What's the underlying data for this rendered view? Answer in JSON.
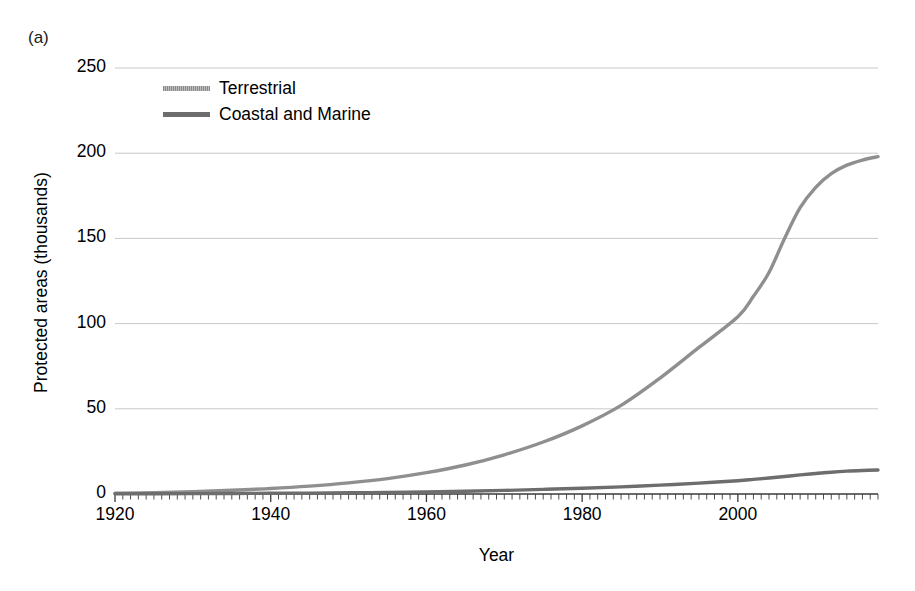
{
  "panel": {
    "label": "(a)"
  },
  "axes": {
    "ylabel": "Protected areas (thousands)",
    "xlabel": "Year",
    "yticks": [
      "0",
      "50",
      "100",
      "150",
      "200",
      "250"
    ],
    "xticks": [
      "1920",
      "1940",
      "1960",
      "1980",
      "2000"
    ]
  },
  "legend": {
    "items": [
      {
        "label": "Terrestrial",
        "color": "#9a9a9a"
      },
      {
        "label": "Coastal and Marine",
        "color": "#6d6d6d"
      }
    ]
  },
  "colors": {
    "terrestrial": "#8f8f8f",
    "coastal": "#6d6d6d",
    "gridline": "#c9c9c9",
    "axis": "#3a3a3a",
    "text": "#000000",
    "background": "#ffffff"
  },
  "chart_data": {
    "type": "line",
    "title": "",
    "subtitle": "",
    "xlabel": "Year",
    "ylabel": "Protected areas (thousands)",
    "xlim": [
      1920,
      2018
    ],
    "ylim": [
      0,
      250
    ],
    "grid": true,
    "legend_position": "top-left",
    "x_major_ticks": [
      1920,
      1940,
      1960,
      1980,
      2000
    ],
    "x_minor_tick_interval": 1,
    "y_ticks": [
      0,
      50,
      100,
      150,
      200,
      250
    ],
    "x": [
      1920,
      1925,
      1930,
      1935,
      1940,
      1945,
      1950,
      1955,
      1960,
      1965,
      1970,
      1975,
      1980,
      1985,
      1990,
      1995,
      2000,
      2002,
      2004,
      2006,
      2008,
      2010,
      2012,
      2014,
      2016,
      2018
    ],
    "series": [
      {
        "name": "Terrestrial",
        "values": [
          0.4,
          0.8,
          1.4,
          2.2,
          3.2,
          4.6,
          6.5,
          9.0,
          12.5,
          17.0,
          23.0,
          30.5,
          40.0,
          52.0,
          68.0,
          86.0,
          104.0,
          116.0,
          130.0,
          150.0,
          168.0,
          180.0,
          188.0,
          193.0,
          196.0,
          198.0
        ]
      },
      {
        "name": "Coastal and Marine",
        "values": [
          0.1,
          0.15,
          0.2,
          0.3,
          0.4,
          0.5,
          0.7,
          0.9,
          1.2,
          1.6,
          2.1,
          2.7,
          3.4,
          4.2,
          5.2,
          6.4,
          7.8,
          8.6,
          9.4,
          10.3,
          11.2,
          12.0,
          12.8,
          13.4,
          13.8,
          14.1
        ]
      }
    ]
  }
}
